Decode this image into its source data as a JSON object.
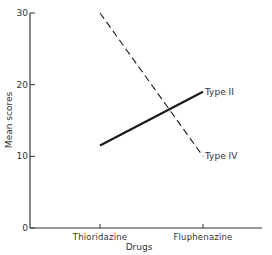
{
  "chart_data": {
    "type": "line",
    "title": "",
    "xlabel": "Drugs",
    "ylabel": "Mean scores",
    "categories": [
      "Thioridazine",
      "Fluphenazine"
    ],
    "series": [
      {
        "name": "Type II",
        "style": "solid",
        "values": [
          11.5,
          19
        ]
      },
      {
        "name": "Type IV",
        "style": "dashed",
        "values": [
          30,
          10
        ]
      }
    ],
    "ylim": [
      0,
      30
    ],
    "yticks": [
      0,
      10,
      20,
      30
    ],
    "ytick_labels": [
      "0",
      "10",
      "20",
      "30"
    ],
    "grid": false,
    "legend": "inline labels at line ends"
  },
  "colors": {
    "line": "#1a1a1a",
    "axis": "#333333"
  }
}
